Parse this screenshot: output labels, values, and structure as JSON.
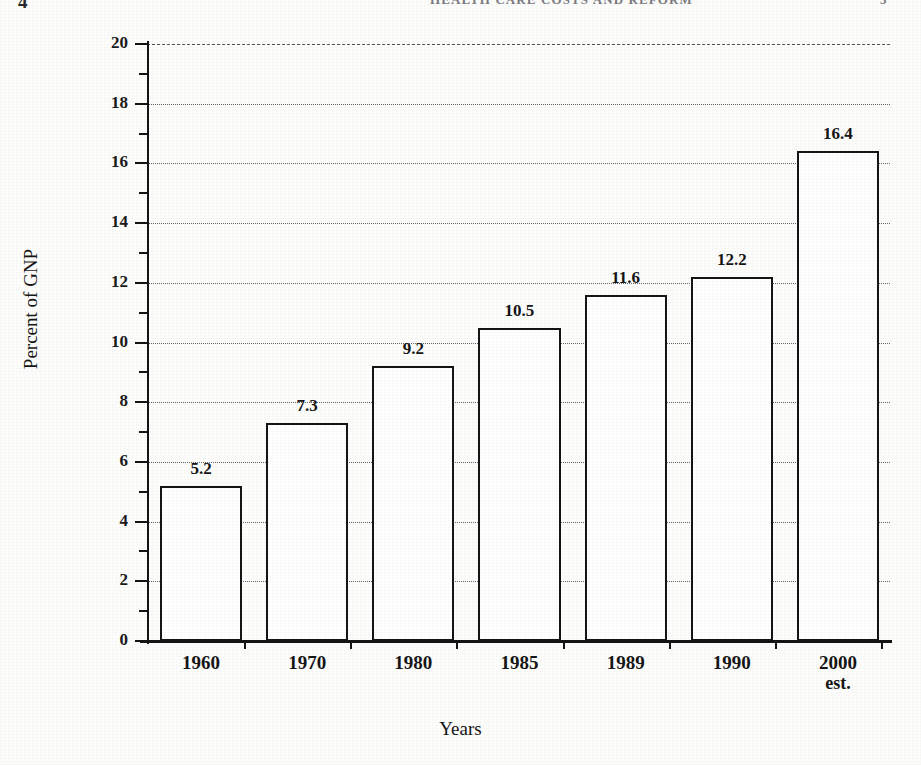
{
  "page": {
    "folio_left": "4",
    "running_head": "HEALTH CARE COSTS AND REFORM",
    "folio_right": "5"
  },
  "chart_data": {
    "type": "bar",
    "title": "",
    "categories": [
      "1960",
      "1970",
      "1980",
      "1985",
      "1989",
      "1990",
      "2000"
    ],
    "category_sublabels": [
      "",
      "",
      "",
      "",
      "",
      "",
      "est."
    ],
    "values": [
      5.2,
      7.3,
      9.2,
      10.5,
      11.6,
      12.2,
      16.4
    ],
    "value_labels": [
      "5.2",
      "7.3",
      "9.2",
      "10.5",
      "11.6",
      "12.2",
      "16.4"
    ],
    "xlabel": "Years",
    "ylabel": "Percent of GNP",
    "ylim": [
      0,
      20
    ],
    "ytick_values": [
      0,
      2,
      4,
      6,
      8,
      10,
      12,
      14,
      16,
      18,
      20
    ],
    "ytick_labels": [
      "0",
      "2",
      "4",
      "6",
      "8",
      "10",
      "12",
      "14",
      "16",
      "18",
      "20"
    ],
    "yminor_values": [
      1,
      3,
      5,
      7,
      9,
      11,
      13,
      15,
      17,
      19
    ],
    "grid": true,
    "grid_axis": "y",
    "legend": false,
    "bar_fill": "#ffffff",
    "bar_edge": "#151515",
    "grid_color": "#4b4b4b",
    "axis_color": "#141414"
  }
}
